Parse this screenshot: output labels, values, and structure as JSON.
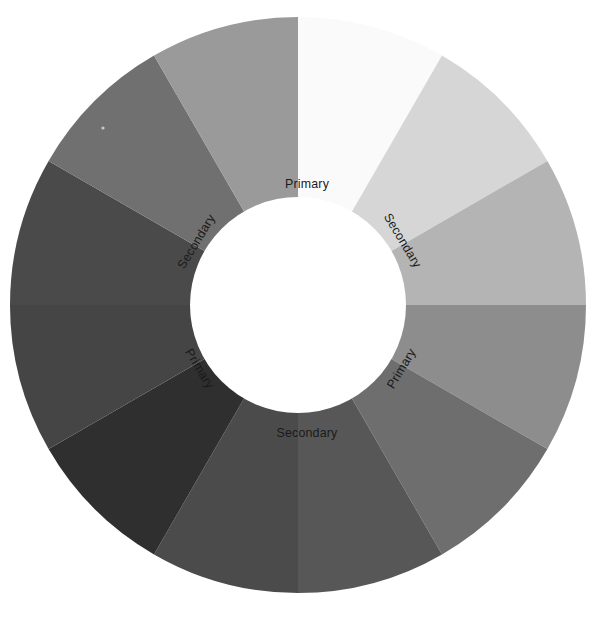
{
  "figure": {
    "name": "color-wheel",
    "background": "#ffffff",
    "width": 600,
    "height": 625
  },
  "chart_data": {
    "type": "pie",
    "title": "",
    "subtitle": "",
    "xlabel": "",
    "ylabel": "",
    "grid": false,
    "legend_position": "none",
    "variant": "donut",
    "center_x": 298,
    "center_y": 305,
    "outer_radius": 288,
    "inner_radius": 108,
    "segment_count": 12,
    "segment_angle_degrees": 30,
    "start_angle_degrees": -90,
    "categories": [
      "Segment 1",
      "Segment 2",
      "Segment 3",
      "Segment 4",
      "Segment 5",
      "Segment 6",
      "Segment 7",
      "Segment 8",
      "Segment 9",
      "Segment 10",
      "Segment 11",
      "Segment 12"
    ],
    "values": [
      8.3333,
      8.3333,
      8.3333,
      8.3333,
      8.3333,
      8.3333,
      8.3333,
      8.3333,
      8.3333,
      8.3333,
      8.3333,
      8.3333
    ],
    "colors": [
      "#fafafa",
      "#d6d6d6",
      "#b4b4b4",
      "#8d8d8d",
      "#6e6e6e",
      "#575757",
      "#4b4b4b",
      "#2f2f2f",
      "#454545",
      "#4a4a4a",
      "#707070",
      "#9a9a9a"
    ],
    "annotations": [
      {
        "text": "Primary",
        "angle_degrees": -90,
        "rotation_degrees": 0,
        "x": 307,
        "y": 185
      },
      {
        "text": "Secondary",
        "angle_degrees": -30,
        "rotation_degrees": 59,
        "x": 402,
        "y": 241
      },
      {
        "text": "Primary",
        "angle_degrees": 30,
        "rotation_degrees": -59,
        "x": 402,
        "y": 369
      },
      {
        "text": "Secondary",
        "angle_degrees": 90,
        "rotation_degrees": 0,
        "x": 307,
        "y": 434
      },
      {
        "text": "Primary",
        "angle_degrees": 150,
        "rotation_degrees": 59,
        "x": 199,
        "y": 369
      },
      {
        "text": "Secondary",
        "angle_degrees": -150,
        "rotation_degrees": -59,
        "x": 197,
        "y": 242
      }
    ]
  },
  "labels": {
    "top_primary": "Primary",
    "right_secondary": "Secondary",
    "right_primary": "Primary",
    "bottom_secondary": "Secondary",
    "left_primary": "Primary",
    "left_secondary": "Secondary"
  },
  "colors": {
    "background": "#ffffff",
    "hub": "#ffffff",
    "text": "#1a1a1a",
    "speck": "#c8c8c8"
  }
}
